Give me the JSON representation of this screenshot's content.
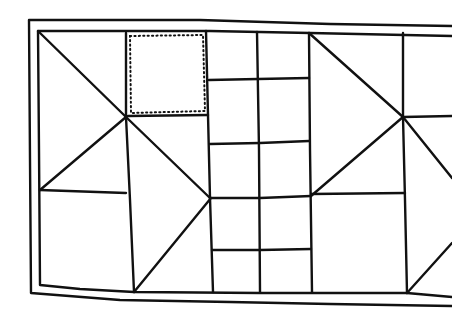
{
  "illustration": {
    "subject": "hand-drawn quilt pattern line drawing",
    "colors": {
      "line": "#111111",
      "background": "#ffffff"
    },
    "blocks": [
      {
        "name": "left-block",
        "type": "triangles-and-squares"
      },
      {
        "name": "dotted-square",
        "type": "highlighted-square",
        "style": "dotted"
      },
      {
        "name": "middle-grid",
        "type": "grid-of-squares",
        "columns": 2,
        "rows": 5
      },
      {
        "name": "right-block",
        "type": "triangles-and-squares"
      }
    ]
  }
}
